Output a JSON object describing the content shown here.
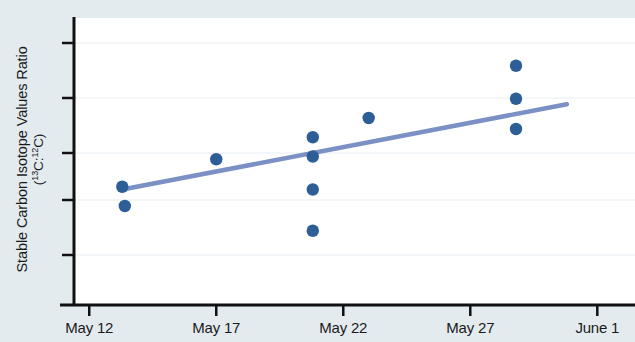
{
  "chart_data": {
    "type": "scatter",
    "title": "",
    "xlabel": "",
    "ylabel_line1": "Stable Carbon Isotope Values Ratio",
    "ylabel_line2": "(13C:12C)",
    "ylabel_line2_pre": "(",
    "ylabel_line2_sup1": "13",
    "ylabel_line2_mid1": "C:",
    "ylabel_line2_sup2": "12",
    "ylabel_line2_post": "C)",
    "x_tick_labels": [
      "May 12",
      "May 17",
      "May 22",
      "May 27",
      "June 1"
    ],
    "x_tick_days": [
      0,
      5,
      10,
      15,
      20
    ],
    "xlim_days": [
      -0.6,
      20.5
    ],
    "y_tick_count": 6,
    "y_tick_labels": [
      "",
      "",
      "",
      "",
      "",
      ""
    ],
    "ylim": [
      0,
      100
    ],
    "grid": true,
    "grid_axis": "y",
    "legend": "none",
    "marker_color": "#2e5e96",
    "trendline_color": "#7b90c4",
    "plot_background": "#ffffff",
    "figure_background": "#e4ebef",
    "axis_color": "#111111",
    "points": [
      {
        "day": 1.3,
        "value": 43.0
      },
      {
        "day": 1.4,
        "value": 36.0
      },
      {
        "day": 5.0,
        "value": 53.0
      },
      {
        "day": 8.8,
        "value": 61.0
      },
      {
        "day": 8.8,
        "value": 54.0
      },
      {
        "day": 8.8,
        "value": 42.0
      },
      {
        "day": 8.8,
        "value": 27.0
      },
      {
        "day": 11.0,
        "value": 68.0
      },
      {
        "day": 16.8,
        "value": 87.0
      },
      {
        "day": 16.8,
        "value": 75.0
      },
      {
        "day": 16.8,
        "value": 64.0
      }
    ],
    "trendline": {
      "x_start_day": 1.3,
      "y_start": 42.0,
      "x_end_day": 18.8,
      "y_end": 73.0,
      "label": "linear fit"
    }
  }
}
